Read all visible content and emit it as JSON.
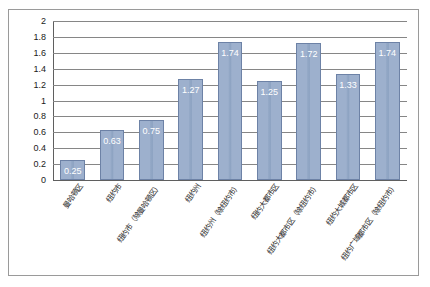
{
  "chart_data": {
    "type": "bar",
    "title": "",
    "subtitle": "",
    "xlabel": "",
    "ylabel": "",
    "ylim": [
      0,
      2
    ],
    "ytick_step": 0.2,
    "grid": true,
    "legend": false,
    "categories": [
      "曼哈顿区",
      "纽约市",
      "纽约市（除曼哈顿区）",
      "纽约州",
      "纽约州（除纽约市）",
      "纽约大都市区",
      "纽约大都市区（除纽约市）",
      "纽约大城都市区",
      "纽约广域都市区（除纽约市）"
    ],
    "values": [
      0.25,
      0.63,
      0.75,
      1.27,
      1.74,
      1.25,
      1.72,
      1.33,
      1.74
    ],
    "data_labels": [
      "0.25",
      "0.63",
      "0.75",
      "1.27",
      "1.74",
      "1.25",
      "1.72",
      "1.33",
      "1.74"
    ],
    "ytick_labels": [
      "2",
      "1.8",
      "1.6",
      "1.4",
      "1.2",
      "1",
      "0.8",
      "0.6",
      "0.4",
      "0.2",
      "0"
    ],
    "ytick_values": [
      2,
      1.8,
      1.6,
      1.4,
      1.2,
      1,
      0.8,
      0.6,
      0.4,
      0.2,
      0
    ],
    "colors": {
      "bar_fill": "#9db0cd",
      "bar_border": "#6d82a6",
      "gridline": "#868686",
      "axis": "#5f5f5f",
      "data_label_text": "#ffffff",
      "tick_text": "#1a1a1a",
      "frame_border": "#9a9a9a",
      "background": "#ffffff"
    }
  }
}
